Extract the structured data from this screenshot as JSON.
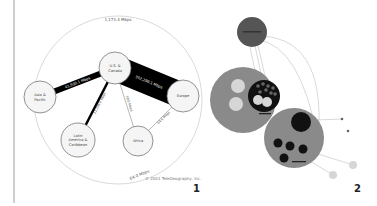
{
  "figure1": {
    "panel_label": "1",
    "copyright": "© 2001 TeleGeography, Inc.",
    "nodes": [
      {
        "id": "asia",
        "label_lines": [
          "Asia &",
          "Pacific"
        ],
        "x": 40,
        "y": 97,
        "r": 16
      },
      {
        "id": "us",
        "label_lines": [
          "U.S. &",
          "Canada"
        ],
        "x": 115,
        "y": 68,
        "r": 16
      },
      {
        "id": "europe",
        "label_lines": [
          "Europe"
        ],
        "x": 183,
        "y": 96,
        "r": 16
      },
      {
        "id": "latam",
        "label_lines": [
          "Latin",
          "America &",
          "Caribbean"
        ],
        "x": 78,
        "y": 140,
        "r": 17
      },
      {
        "id": "africa",
        "label_lines": [
          "Africa"
        ],
        "x": 138,
        "y": 141,
        "r": 15
      }
    ],
    "links": [
      {
        "from": "us",
        "to": "europe",
        "label": "352,299.1 Mbps",
        "width": 26
      },
      {
        "from": "asia",
        "to": "us",
        "label": "41,930.1 Mbps",
        "width": 6
      },
      {
        "from": "us",
        "to": "latam",
        "label": "11,108.6 Mbps",
        "width": 2.5
      },
      {
        "from": "us",
        "to": "africa",
        "label": "58.6 Mbps",
        "width": 0.6
      },
      {
        "from": "europe",
        "to": "africa",
        "label": "64.6 Mbps",
        "width": 0.6
      }
    ],
    "arc_labels": {
      "top": "1,173.4 Mbps",
      "bottom": "64.0 Mbps"
    }
  },
  "figure2": {
    "panel_label": "2",
    "colors": {
      "dark": "#555555",
      "mid": "#8a8a8a",
      "black": "#111111",
      "light": "#d6d6d6",
      "line": "#c8c8c8"
    }
  }
}
